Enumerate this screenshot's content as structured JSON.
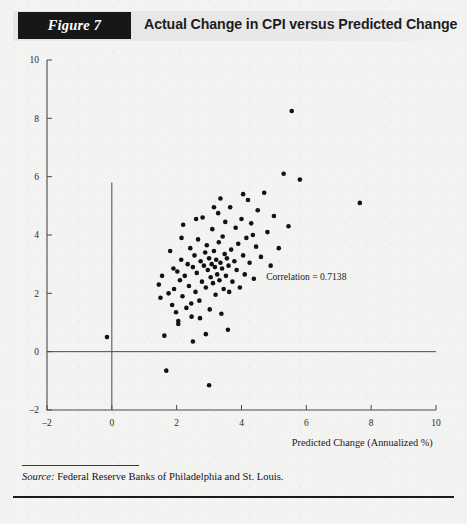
{
  "figure": {
    "badge": "Figure 7",
    "title": "Actual Change in CPI versus Predicted Change"
  },
  "source": {
    "label": "Source:",
    "text": " Federal Reserve Banks of Philadelphia and St. Louis."
  },
  "colors": {
    "badge_bg": "#17171a",
    "badge_text": "#ffffff",
    "band_bg": "#e8e8e6",
    "page_bg": "#f3f3f2",
    "axis": "#4a4a4a",
    "point": "#111111",
    "rule": "#1b1b1b"
  },
  "chart_data": {
    "type": "scatter",
    "title": "Actual Change in CPI versus Predicted Change",
    "xlabel": "Predicted Change (Annualized %)",
    "ylabel": "",
    "xlim": [
      -2,
      10
    ],
    "ylim": [
      -2,
      10
    ],
    "xticks": [
      -2,
      0,
      2,
      4,
      6,
      8,
      10
    ],
    "yticks": [
      -2,
      0,
      2,
      4,
      6,
      8,
      10
    ],
    "xticklabels": [
      "–2",
      "0",
      "2",
      "4",
      "6",
      "8",
      "10"
    ],
    "yticklabels": [
      "–2",
      "0",
      "2",
      "4",
      "6",
      "8",
      "10"
    ],
    "grid": false,
    "legend": null,
    "zero_lines": {
      "x": 0,
      "y": 0
    },
    "annotations": [
      {
        "text": "Correlation = 0.7138",
        "x": 6.0,
        "y": 2.45
      }
    ],
    "marker": {
      "shape": "circle",
      "size_px": 4.6,
      "color": "#111111"
    },
    "points": [
      [
        -0.15,
        0.5
      ],
      [
        1.45,
        2.3
      ],
      [
        1.5,
        1.85
      ],
      [
        1.55,
        2.6
      ],
      [
        1.62,
        0.55
      ],
      [
        1.68,
        -0.65
      ],
      [
        1.75,
        2.0
      ],
      [
        1.8,
        3.45
      ],
      [
        1.86,
        1.6
      ],
      [
        1.92,
        2.15
      ],
      [
        1.98,
        1.35
      ],
      [
        2.02,
        2.75
      ],
      [
        2.05,
        1.05
      ],
      [
        2.1,
        2.45
      ],
      [
        2.14,
        3.15
      ],
      [
        2.18,
        1.9
      ],
      [
        2.2,
        4.35
      ],
      [
        2.25,
        2.6
      ],
      [
        2.3,
        1.5
      ],
      [
        2.34,
        3.0
      ],
      [
        2.38,
        2.25
      ],
      [
        2.42,
        3.55
      ],
      [
        2.46,
        1.2
      ],
      [
        2.5,
        2.9
      ],
      [
        2.55,
        3.3
      ],
      [
        2.58,
        2.05
      ],
      [
        2.62,
        2.7
      ],
      [
        2.66,
        3.85
      ],
      [
        2.7,
        1.75
      ],
      [
        2.74,
        3.1
      ],
      [
        2.78,
        2.4
      ],
      [
        2.8,
        4.6
      ],
      [
        2.84,
        2.95
      ],
      [
        2.88,
        3.4
      ],
      [
        2.9,
        2.2
      ],
      [
        2.93,
        3.65
      ],
      [
        2.96,
        2.8
      ],
      [
        3.0,
        3.2
      ],
      [
        3.02,
        1.45
      ],
      [
        3.05,
        2.55
      ],
      [
        3.08,
        3.0
      ],
      [
        3.1,
        4.2
      ],
      [
        3.12,
        2.35
      ],
      [
        3.15,
        3.45
      ],
      [
        3.18,
        2.9
      ],
      [
        3.2,
        1.95
      ],
      [
        3.22,
        3.15
      ],
      [
        3.25,
        2.65
      ],
      [
        3.28,
        4.75
      ],
      [
        3.3,
        3.75
      ],
      [
        3.32,
        2.45
      ],
      [
        3.35,
        3.05
      ],
      [
        3.38,
        1.3
      ],
      [
        3.4,
        2.85
      ],
      [
        3.42,
        3.95
      ],
      [
        3.45,
        2.15
      ],
      [
        3.48,
        3.35
      ],
      [
        3.5,
        4.45
      ],
      [
        3.52,
        2.6
      ],
      [
        3.55,
        3.2
      ],
      [
        3.58,
        0.75
      ],
      [
        3.6,
        2.95
      ],
      [
        3.65,
        4.95
      ],
      [
        3.68,
        3.5
      ],
      [
        3.72,
        2.4
      ],
      [
        3.78,
        3.1
      ],
      [
        3.82,
        4.25
      ],
      [
        3.85,
        2.8
      ],
      [
        3.9,
        3.7
      ],
      [
        3.95,
        2.2
      ],
      [
        4.0,
        4.55
      ],
      [
        4.05,
        3.3
      ],
      [
        4.1,
        2.65
      ],
      [
        4.15,
        3.9
      ],
      [
        4.2,
        5.2
      ],
      [
        4.25,
        3.05
      ],
      [
        4.3,
        4.4
      ],
      [
        4.38,
        2.5
      ],
      [
        4.45,
        3.6
      ],
      [
        4.5,
        4.85
      ],
      [
        4.6,
        3.25
      ],
      [
        4.7,
        5.45
      ],
      [
        4.8,
        4.1
      ],
      [
        4.9,
        2.95
      ],
      [
        5.0,
        4.65
      ],
      [
        5.15,
        3.55
      ],
      [
        5.3,
        6.1
      ],
      [
        5.45,
        4.3
      ],
      [
        5.55,
        8.25
      ],
      [
        5.8,
        5.9
      ],
      [
        7.65,
        5.1
      ],
      [
        3.0,
        -1.15
      ],
      [
        2.5,
        0.35
      ],
      [
        2.05,
        0.95
      ],
      [
        2.9,
        0.6
      ],
      [
        1.9,
        2.85
      ],
      [
        2.15,
        3.9
      ],
      [
        2.6,
        4.55
      ],
      [
        3.35,
        5.25
      ],
      [
        4.35,
        4.0
      ],
      [
        2.45,
        1.65
      ],
      [
        2.72,
        1.15
      ],
      [
        3.62,
        2.05
      ],
      [
        4.05,
        5.4
      ],
      [
        3.15,
        4.95
      ]
    ],
    "correlation": 0.7138
  }
}
